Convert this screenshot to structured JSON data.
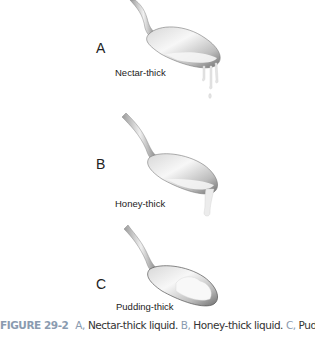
{
  "figure": {
    "panels": [
      {
        "letter": "A",
        "label": "Nectar-thick",
        "liquid": "thin drips"
      },
      {
        "letter": "B",
        "label": "Honey-thick",
        "liquid": "thick pour"
      },
      {
        "letter": "C",
        "label": "Pudding-thick",
        "liquid": "mound in bowl"
      }
    ],
    "caption": {
      "figure_number": "FIGURE 29-2",
      "parts": [
        {
          "key": "A,",
          "text": "Nectar-thick liquid."
        },
        {
          "key": "B,",
          "text": "Honey-thick liquid."
        },
        {
          "key": "C,",
          "text": "Pudding-"
        }
      ]
    },
    "colors": {
      "caption_accent": "#8a9bb0",
      "text": "#222222"
    }
  }
}
